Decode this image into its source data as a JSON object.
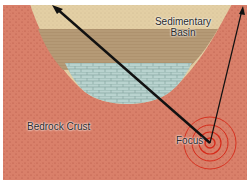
{
  "diagram": {
    "labels": {
      "basin_line1": "Sedimentary",
      "basin_line2": "Basin",
      "bedrock": "Bedrock Crust",
      "focus": "Focus"
    },
    "colors": {
      "bedrock": "#d9806a",
      "bedrock_dots": "#b5513f",
      "sand_top": "#e3cfa4",
      "brown_layer": "#b59a76",
      "limestone": "#b9d3cf",
      "limestone_lines": "#8aa9a5",
      "wave_rings": "#d62a1a",
      "ray": "#111111"
    },
    "elements": {
      "layers": [
        "sand (top)",
        "shale/siltstone (middle)",
        "limestone (bottom)"
      ],
      "rays": [
        {
          "from": "Focus",
          "to": "top-left basin surface",
          "weight": "thick"
        },
        {
          "from": "Focus",
          "to": "top-right bedrock surface",
          "weight": "thin"
        }
      ],
      "wave_rings": 4
    }
  }
}
